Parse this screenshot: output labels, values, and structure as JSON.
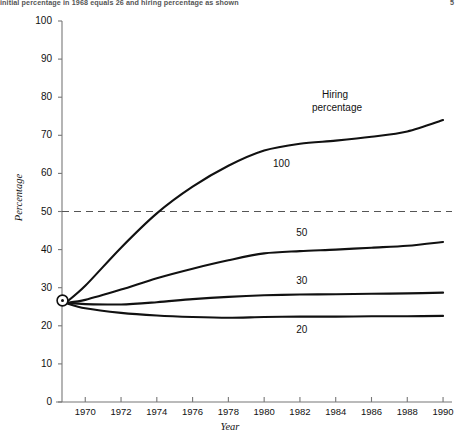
{
  "caption": {
    "text": "initial percentage in 1968 equals 26 and hiring percentage as shown",
    "page_number": "5"
  },
  "chart_data": {
    "type": "line",
    "title": "",
    "xlabel": "Year",
    "ylabel": "Percentage",
    "xlim": [
      1968.7,
      1990.5
    ],
    "ylim": [
      0,
      100
    ],
    "xticks": [
      1970,
      1972,
      1974,
      1976,
      1978,
      1980,
      1982,
      1984,
      1986,
      1988,
      1990
    ],
    "yticks": [
      0,
      10,
      20,
      30,
      40,
      50,
      60,
      70,
      80,
      90,
      100
    ],
    "grid": false,
    "legend_position": "inline-右 (labels at end of each curve)",
    "legend_title": "Hiring\npercentage",
    "legend_title_line1": "Hiring",
    "legend_title_line2": "percentage",
    "start_marker": {
      "x": 1968.9,
      "y": 26,
      "style": "circled-dot"
    },
    "reference_line": {
      "y": 50,
      "style": "dashed",
      "color": "#555555"
    },
    "x": [
      1968.9,
      1970,
      1972,
      1974,
      1976,
      1978,
      1980,
      1982,
      1984,
      1986,
      1988,
      1990
    ],
    "series": [
      {
        "name": "100",
        "label": "100",
        "values": [
          26,
          30.5,
          40.5,
          49.5,
          56.5,
          62.0,
          66.0,
          67.8,
          68.6,
          69.6,
          71.0,
          74.0
        ]
      },
      {
        "name": "50",
        "label": "50",
        "values": [
          26,
          26.8,
          29.5,
          32.5,
          35.0,
          37.2,
          39.0,
          39.6,
          40.0,
          40.5,
          41.0,
          42.0
        ]
      },
      {
        "name": "30",
        "label": "30",
        "values": [
          26,
          25.7,
          25.6,
          26.2,
          27.0,
          27.6,
          28.0,
          28.2,
          28.3,
          28.4,
          28.5,
          28.7
        ]
      },
      {
        "name": "20",
        "label": "20",
        "values": [
          26,
          24.6,
          23.4,
          22.7,
          22.3,
          22.1,
          22.3,
          22.4,
          22.4,
          22.5,
          22.5,
          22.6
        ]
      }
    ],
    "axis_color": "#777777",
    "curve_color": "#111111"
  }
}
